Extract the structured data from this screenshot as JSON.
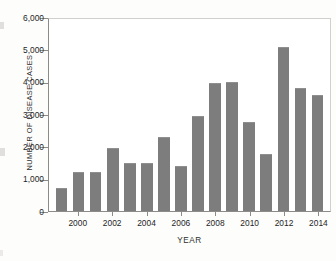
{
  "chart_data": {
    "type": "bar",
    "title": "",
    "xlabel": "YEAR",
    "ylabel": "NUMBER OF DISEASE CASES",
    "categories": [
      1999,
      2000,
      2001,
      2002,
      2003,
      2004,
      2005,
      2006,
      2007,
      2008,
      2009,
      2010,
      2011,
      2012,
      2013,
      2014
    ],
    "values": [
      700,
      1200,
      1200,
      1950,
      1500,
      1500,
      2300,
      1400,
      2950,
      3950,
      3980,
      2750,
      1750,
      5080,
      3820,
      3580
    ],
    "ylim": [
      0,
      6000
    ],
    "ytick_values": [
      0,
      1000,
      2000,
      3000,
      4000,
      5000,
      6000
    ],
    "ytick_labels": [
      "0",
      "1,000",
      "2,000",
      "3,000",
      "4,000",
      "5,000",
      "6,000"
    ],
    "xtick_values": [
      2000,
      2002,
      2004,
      2006,
      2008,
      2010,
      2012,
      2014
    ],
    "xtick_labels": [
      "2000",
      "2002",
      "2004",
      "2006",
      "2008",
      "2010",
      "2012",
      "2014"
    ],
    "grid": false,
    "legend": false,
    "bar_color": "#7d7d7d",
    "axis_color": "#8d8b88",
    "frame_color": "#d2d0cd"
  }
}
